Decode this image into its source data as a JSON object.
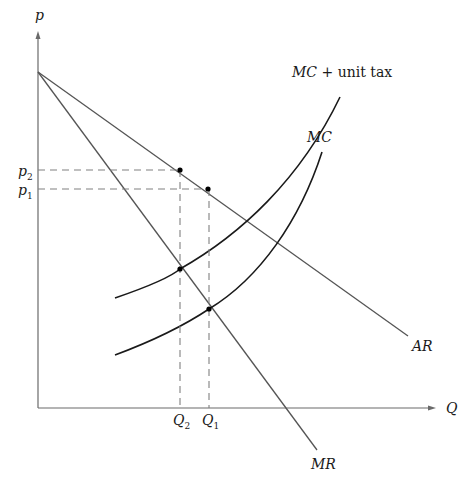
{
  "diagram": {
    "title": "",
    "axes": {
      "y_label": "p",
      "x_label": "Q"
    },
    "curves": {
      "ar": {
        "label": "AR"
      },
      "mr": {
        "label": "MR"
      },
      "mc": {
        "label": "MC"
      },
      "mc_tax": {
        "label_italic": "MC",
        "label_plain": " + unit tax"
      }
    },
    "price_levels": [
      {
        "name": "p",
        "sub": "2"
      },
      {
        "name": "p",
        "sub": "1"
      }
    ],
    "quantity_levels": [
      {
        "name": "Q",
        "sub": "2"
      },
      {
        "name": "Q",
        "sub": "1"
      }
    ],
    "colors": {
      "curve": "#1a1a1a",
      "line": "#555555",
      "dashed": "#808080",
      "background": "#ffffff"
    }
  }
}
